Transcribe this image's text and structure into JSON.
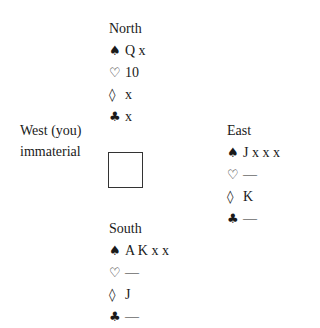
{
  "north": {
    "title": "North",
    "spades": "Q x",
    "hearts": "10",
    "diamonds": "x",
    "clubs": "x"
  },
  "west": {
    "title": "West (you)",
    "note": "immaterial"
  },
  "east": {
    "title": "East",
    "spades": "J x x x",
    "hearts": "—",
    "diamonds": "K",
    "clubs": "—"
  },
  "south": {
    "title": "South",
    "spades": "A K x x",
    "hearts": "—",
    "diamonds": "J",
    "clubs": "—"
  },
  "suits": {
    "spades": "♠",
    "hearts": "♡",
    "diamonds": "◊",
    "clubs": "♣"
  }
}
